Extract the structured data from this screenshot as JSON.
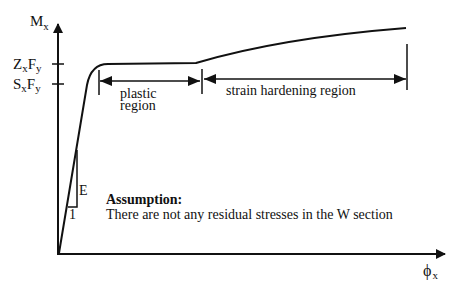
{
  "diagram": {
    "type": "moment-curvature",
    "colors": {
      "ink": "#111111",
      "background": "#ffffff"
    },
    "axes": {
      "y_label": "M",
      "y_label_sub": "x",
      "x_label": "ϕ",
      "x_label_sub": "x",
      "y_ticks": [
        {
          "parts": [
            "Z",
            "x",
            "F",
            "y"
          ],
          "y": 64
        },
        {
          "parts": [
            "S",
            "x",
            "F",
            "y"
          ],
          "y": 84
        }
      ]
    },
    "regions": {
      "plastic": {
        "line1": "plastic",
        "line2": "region"
      },
      "strain_hardening": {
        "label": "strain hardening region"
      }
    },
    "slope": {
      "rise_label": "E",
      "run_label": "1"
    },
    "assumption": {
      "title": "Assumption:",
      "text": "There are not any residual stresses in the W section"
    }
  }
}
